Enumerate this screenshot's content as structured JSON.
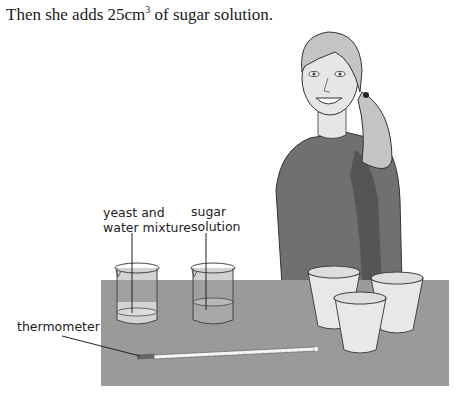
{
  "caption": {
    "prefix": "Then she adds 25",
    "unit": "cm",
    "exponent": "3",
    "suffix": " of sugar solution."
  },
  "labels": {
    "yeast_line1": "yeast and",
    "yeast_line2": "water mixture",
    "sugar_line1": "sugar",
    "sugar_line2": "solution",
    "thermometer": "thermometer"
  },
  "colors": {
    "table": "#9a9a9a",
    "sweater": "#707070",
    "hair": "#c4c4c4",
    "skin": "#e6e6e6",
    "cup": "#e8e8e8",
    "liquid": "#d4d4d4"
  }
}
